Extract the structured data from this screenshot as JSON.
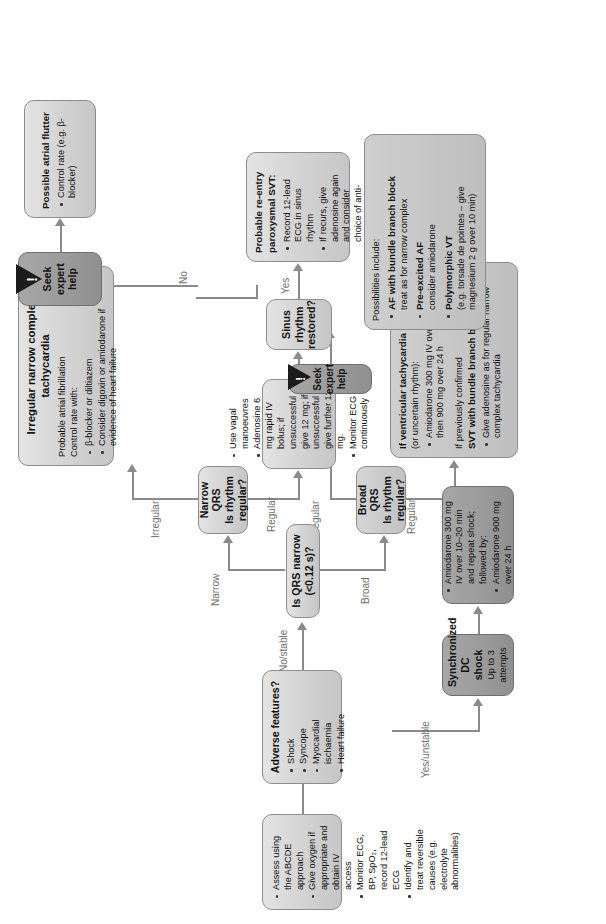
{
  "diagram": {
    "colors": {
      "box_fill": "#d9d9d9",
      "box_border": "#8d8d8d",
      "dark_box_fill": "#9a9a9a",
      "connector": "#8a8a8a",
      "label_text": "#6e6e6e",
      "warning": "#1c1c1c"
    }
  },
  "nodes": {
    "assess": {
      "name": "initial-assessment",
      "items": [
        "Assess using the ABCDE approach",
        "Give oxygen if appropriate and obtain IV access",
        "Monitor ECG, BP, SpO₂, record 12-lead ECG",
        "Identify and treat reversible causes (e.g. electrolyte abnormalities)"
      ]
    },
    "adverse": {
      "name": "adverse-features-decision",
      "title": "Adverse features?",
      "items": [
        "Shock",
        "Syncope",
        "Myocardial ischaemia",
        "Heart failure"
      ]
    },
    "dc_shock": {
      "name": "synchronised-dc-shock",
      "title": "Synchronized DC shock",
      "subtitle": "Up to 3 attempts"
    },
    "amiodarone": {
      "name": "amiodarone-after-shock",
      "items": [
        "Amiodarone 300 mg IV over 10–20 min and repeat shock; followed by:",
        "Amiodarone 900 mg over 24 h"
      ]
    },
    "qrs_narrow": {
      "name": "is-qrs-narrow-decision",
      "title": "Is QRS narrow (<0.12 s)?"
    },
    "narrow_qrs": {
      "name": "narrow-qrs-rhythm-decision",
      "line1": "Narrow QRS",
      "line2": "Is rhythm regular?"
    },
    "broad_qrs": {
      "name": "broad-qrs-rhythm-decision",
      "line1": "Broad QRS",
      "line2": "Is rhythm regular?"
    },
    "vagal": {
      "name": "vagal-adenosine-actions",
      "items": [
        "Use vagal manoeuvres",
        "Adenosine 6 mg rapid IV bolus; if unsuccessful give 12 mg; if unsuccessful give further 12 mg.",
        "Monitor ECG continuously"
      ]
    },
    "sinus_restored": {
      "name": "sinus-rhythm-restored-decision",
      "title": "Sinus rhythm restored?"
    },
    "svt": {
      "name": "probable-reentry-svt",
      "title": "Probable re-entry paroxysmal SVT:",
      "items": [
        "Record 12-lead ECG in sinus rhythm",
        "If recurs, give adenosine again and consider choice of anti-arrhythmic prophylaxis"
      ]
    },
    "irregular_narrow": {
      "name": "irregular-narrow-complex-tachycardia",
      "title_line1": "Irregular narrow complex",
      "title_line2": "tachycardia",
      "body_line1": "Probable atrial fibrillation",
      "body_line2": "Control rate with:",
      "items": [
        "β-blocker or diltiazem",
        "Consider digoxin or amiodarone if evidence of heart failure"
      ]
    },
    "seek_help_top": {
      "name": "seek-expert-help-top",
      "label": "Seek expert help",
      "icon": "warning-triangle-icon"
    },
    "atrial_flutter": {
      "name": "possible-atrial-flutter",
      "title": "Possible atrial flutter",
      "items": [
        "Control rate (e.g. β-blocker)"
      ]
    },
    "vt": {
      "name": "ventricular-tachycardia-treatment",
      "head1": "If ventricular tachycardia",
      "head1b": "(or uncertain rhythm):",
      "items1": [
        "Amiodarone 300 mg IV over 20–60 min; then 900 mg over 24 h"
      ],
      "head2a": "If previously confirmed",
      "head2b": "SVT with bundle branch block:",
      "items2": [
        "Give adenosine as for regular narrow complex tachycardia"
      ]
    },
    "seek_help_bottom": {
      "name": "seek-expert-help-bottom",
      "label": "Seek expert help",
      "icon": "warning-triangle-icon"
    },
    "possibilities": {
      "name": "irregular-broad-possibilities",
      "intro": "Possibilities include:",
      "items": [
        {
          "bold": "AF with bundle branch block",
          "rest": "treat as for narrow complex"
        },
        {
          "bold": "Pre-excited AF",
          "rest": "consider amiodarone"
        },
        {
          "bold": "Polymorphic VT",
          "rest": "(e.g. torsade de pointes – give magnesium 2 g over 10 min)"
        }
      ]
    }
  },
  "edge_labels": {
    "yes_unstable": "Yes/unstable",
    "no_stable": "No/stable",
    "broad": "Broad",
    "narrow": "Narrow",
    "regular_narrow": "Regular",
    "irregular_narrow": "Irregular",
    "regular_broad": "Regular",
    "irregular_broad": "Irregular",
    "yes": "Yes",
    "no": "No"
  }
}
